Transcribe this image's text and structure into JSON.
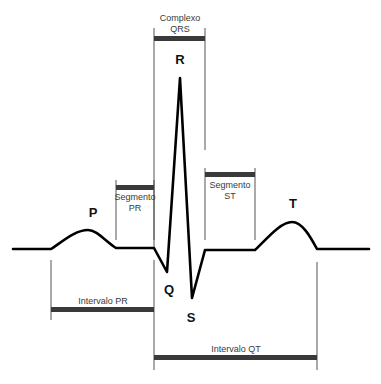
{
  "diagram": {
    "colors": {
      "waveform": "#000000",
      "guide_lines": "#555555",
      "interval_bars": "#3a3a3a",
      "background": "#ffffff"
    },
    "waves": {
      "p": "P",
      "q": "Q",
      "r": "R",
      "s": "S",
      "t": "T"
    },
    "segments": {
      "qrs_complex": "Complexo\nQRS",
      "pr_segment": "Segmento\nPR",
      "st_segment": "Segmento\nST"
    },
    "intervals": {
      "pr_interval": "Intervalo PR",
      "qt_interval": "Intervalo QT"
    }
  }
}
